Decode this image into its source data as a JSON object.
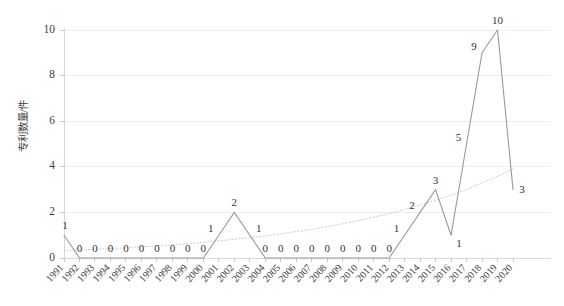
{
  "chart_data": {
    "type": "line",
    "title": "",
    "xlabel": "",
    "ylabel": "专利数量/件",
    "ylim": [
      0,
      10
    ],
    "ytick_values": [
      0,
      2,
      4,
      6,
      8,
      10
    ],
    "ytick_labels": [
      "0",
      "2",
      "4",
      "6",
      "8",
      "10"
    ],
    "grid": true,
    "legend": "none",
    "categories": [
      "1991",
      "1992",
      "1993",
      "1994",
      "1995",
      "1996",
      "1997",
      "1998",
      "1999",
      "2000",
      "2001",
      "2002",
      "2003",
      "2004",
      "2005",
      "2006",
      "2007",
      "2008",
      "2009",
      "2010",
      "2011",
      "2012",
      "2013",
      "2014",
      "2015",
      "2016",
      "2017",
      "2018",
      "2019",
      "2020"
    ],
    "values": [
      1,
      0,
      0,
      0,
      0,
      0,
      0,
      0,
      0,
      0,
      1,
      2,
      1,
      0,
      0,
      0,
      0,
      0,
      0,
      0,
      0,
      0,
      1,
      2,
      3,
      1,
      5,
      9,
      10,
      3
    ],
    "point_labels": [
      "1",
      "0",
      "0",
      "0",
      "0",
      "0",
      "0",
      "0",
      "0",
      "0",
      "1",
      "2",
      "1",
      "0",
      "0",
      "0",
      "0",
      "0",
      "0",
      "0",
      "0",
      "0",
      "1",
      "2",
      "3",
      "1",
      "5",
      "9",
      "10",
      "3"
    ],
    "series": [
      {
        "name": "专利数量",
        "style": "solid",
        "color": "#9a9a9a",
        "values": [
          1,
          0,
          0,
          0,
          0,
          0,
          0,
          0,
          0,
          0,
          1,
          2,
          1,
          0,
          0,
          0,
          0,
          0,
          0,
          0,
          0,
          0,
          1,
          2,
          3,
          1,
          5,
          9,
          10,
          3
        ]
      },
      {
        "name": "趋势线",
        "style": "dotted",
        "color": "#cfcfd4",
        "trend_type": "exponential",
        "values": [
          0.32,
          0.35,
          0.38,
          0.41,
          0.45,
          0.49,
          0.53,
          0.58,
          0.63,
          0.69,
          0.75,
          0.82,
          0.89,
          0.97,
          1.06,
          1.16,
          1.26,
          1.38,
          1.5,
          1.64,
          1.79,
          1.95,
          2.13,
          2.32,
          2.53,
          2.76,
          3.01,
          3.29,
          3.58,
          3.91
        ]
      }
    ]
  },
  "axis": {
    "y_title": "专利数量/件"
  }
}
